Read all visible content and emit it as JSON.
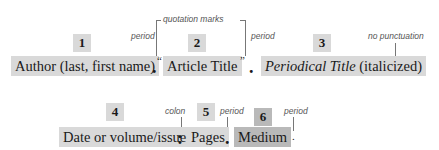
{
  "row1": {
    "items": [
      {
        "number": "1",
        "label": "Author (last, first name)"
      },
      {
        "number": "2",
        "label": "Article Title"
      },
      {
        "number": "3",
        "label_italic": "Periodical Title",
        "label_suffix": " (italicized)"
      }
    ],
    "punctuation": {
      "period": ".",
      "open_quote": "“",
      "close_quote": "”"
    },
    "notes": {
      "period_1": "period",
      "quotation_marks": "quotation marks",
      "period_2": "period",
      "no_punctuation": "no punctuation"
    }
  },
  "row2": {
    "items": [
      {
        "number": "4",
        "label": "Date or volume/issue"
      },
      {
        "number": "5",
        "label": "Pages"
      },
      {
        "number": "6",
        "label": "Medium"
      }
    ],
    "punctuation": {
      "colon": ":",
      "period": "."
    },
    "notes": {
      "colon": "colon",
      "period_1": "period",
      "period_2": "period"
    }
  },
  "colors": {
    "box": "#d9d9d9",
    "box_dark": "#b9b9b9",
    "text": "#1a1a1a",
    "note": "#555555"
  }
}
